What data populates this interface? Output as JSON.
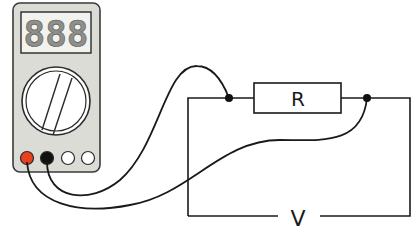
{
  "diagram": {
    "multimeter": {
      "display_text": "888",
      "body_color": "#dcdcd6",
      "display_bg": "#f4f4f0",
      "segment_color": "#9a9a96",
      "terminals": [
        {
          "name": "positive",
          "color": "#e8411f"
        },
        {
          "name": "common",
          "color": "#111111"
        },
        {
          "name": "aux1",
          "color": "#ffffff"
        },
        {
          "name": "aux2",
          "color": "#ffffff"
        }
      ]
    },
    "resistor": {
      "label": "R"
    },
    "source": {
      "label": "V"
    },
    "colors": {
      "wire": "#1a1a1a",
      "node": "#111111"
    }
  }
}
